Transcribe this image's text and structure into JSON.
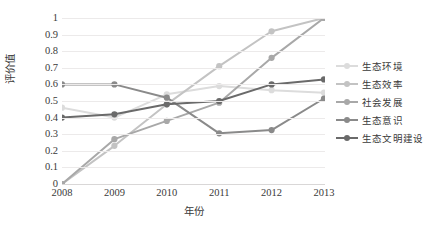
{
  "chart_data": {
    "type": "line",
    "title": "",
    "xlabel": "年份",
    "ylabel": "评价值",
    "categories": [
      "2008",
      "2009",
      "2010",
      "2011",
      "2012",
      "2013"
    ],
    "x": [
      2008,
      2009,
      2010,
      2011,
      2012,
      2013
    ],
    "ylim": [
      0,
      1
    ],
    "ytick_labels": [
      "0",
      "0.1",
      "0.2",
      "0.3",
      "0.4",
      "0.5",
      "0.6",
      "0.7",
      "0.8",
      "0.9",
      "1"
    ],
    "ytick_values": [
      0,
      0.1,
      0.2,
      0.3,
      0.4,
      0.5,
      0.6,
      0.7,
      0.8,
      0.9,
      1
    ],
    "grid": "horizontal",
    "legend_position": "right",
    "markers": "circle",
    "series": [
      {
        "name": "生态环境",
        "color": "#dcdcdc",
        "values": [
          0.46,
          0.4,
          0.54,
          0.59,
          0.565,
          0.55
        ]
      },
      {
        "name": "生态效率",
        "color": "#c3c3c3",
        "values": [
          0.0,
          0.23,
          0.48,
          0.71,
          0.92,
          1.0
        ]
      },
      {
        "name": "社会发展",
        "color": "#a8a8a8",
        "values": [
          0.0,
          0.27,
          0.38,
          0.49,
          0.76,
          1.0
        ]
      },
      {
        "name": "生态意识",
        "color": "#8a8a8a",
        "values": [
          0.6,
          0.6,
          0.52,
          0.305,
          0.325,
          0.515
        ]
      },
      {
        "name": "生态文明建设",
        "color": "#6a6a6a",
        "values": [
          0.4,
          0.42,
          0.48,
          0.5,
          0.6,
          0.63
        ]
      }
    ]
  }
}
